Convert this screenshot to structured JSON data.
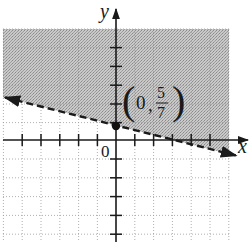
{
  "graph": {
    "type": "linear-inequality-graph",
    "axes": {
      "x_label": "x",
      "y_label": "y",
      "origin_label": "0"
    },
    "boundary_line": {
      "style": "dashed",
      "equation": "y = -(2/7)x + 5/7",
      "direction": "arrows both ends"
    },
    "shaded_region": "above the line",
    "point": {
      "label": "(0, 5/7)",
      "x_text": "0",
      "numerator": "5",
      "denominator": "7"
    },
    "colors": {
      "shade": "#b8b8b8",
      "axis": "#1a1a1a",
      "grid": "#9a9a9a",
      "background": "#ffffff"
    }
  }
}
